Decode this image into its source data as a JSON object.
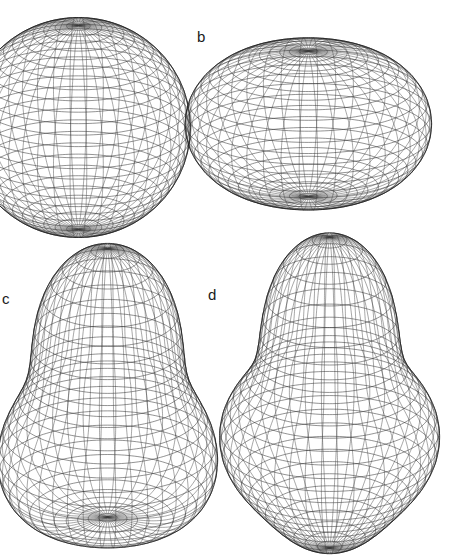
{
  "figure": {
    "background_color": "#ffffff",
    "line_color": "#2b2b2b",
    "label_color": "#1a1a1a",
    "width": 452,
    "height": 447
  },
  "panels": [
    {
      "id": "a",
      "label": "",
      "label_visible": false,
      "shape_name": "sphere",
      "description": "spherical wireframe surface of revolution, cropped at the left edge of the figure",
      "center_x": 78,
      "center_y": 127,
      "radius_x": 112,
      "radius_y": 110,
      "parallels": 30,
      "meridians": 42,
      "view_tilt_deg": 22,
      "deformation": {
        "beta2": 0.0,
        "beta3": 0.0,
        "beta4": 0.0
      }
    },
    {
      "id": "b",
      "label": "b",
      "label_visible": true,
      "label_x": 197,
      "label_y": 29,
      "shape_name": "oblate-spheroid",
      "description": "oblate (flattened) spheroid, wider than tall",
      "center_x": 308,
      "center_y": 124,
      "radius_x": 112,
      "radius_y": 98,
      "parallels": 30,
      "meridians": 42,
      "view_tilt_deg": 22,
      "deformation": {
        "beta2": -0.2,
        "beta3": 0.0,
        "beta4": 0.0
      }
    },
    {
      "id": "c",
      "label": "c",
      "label_visible": true,
      "label_x": 2,
      "label_y": 291,
      "shape_name": "pear-teardrop",
      "description": "pear-shaped (octupole deformed) surface, narrow pointed top widening toward a broad base, cropped at the bottom edge",
      "center_x": 108,
      "center_y": 420,
      "radius_x": 108,
      "radius_y": 126,
      "parallels": 30,
      "meridians": 42,
      "view_tilt_deg": 22,
      "deformation": {
        "beta2": 0.15,
        "beta3": 0.32,
        "beta4": 0.0
      }
    },
    {
      "id": "d",
      "label": "d",
      "label_visible": true,
      "label_x": 208,
      "label_y": 287,
      "shape_name": "necked-bulged",
      "description": "necked shape with a flattened dome, a constricted waist in the upper third and a bulging lower body, cropped at the bottom edge",
      "center_x": 330,
      "center_y": 418,
      "radius_x": 108,
      "radius_y": 126,
      "parallels": 30,
      "meridians": 42,
      "view_tilt_deg": 22,
      "deformation": {
        "beta2": 0.15,
        "beta3": 0.22,
        "beta4": 0.18
      }
    }
  ],
  "chart_data": {
    "type": "line",
    "title": "",
    "xlabel": "",
    "ylabel": "",
    "series": [
      {
        "name": "a",
        "values": [
          0.0,
          0.0,
          0.0
        ]
      },
      {
        "name": "b",
        "values": [
          -0.2,
          0.0,
          0.0
        ]
      },
      {
        "name": "c",
        "values": [
          0.15,
          0.32,
          0.0
        ]
      },
      {
        "name": "d",
        "values": [
          0.15,
          0.22,
          0.18
        ]
      }
    ],
    "categories": [
      "beta2",
      "beta3",
      "beta4"
    ],
    "legend_position": "none",
    "grid": false
  }
}
